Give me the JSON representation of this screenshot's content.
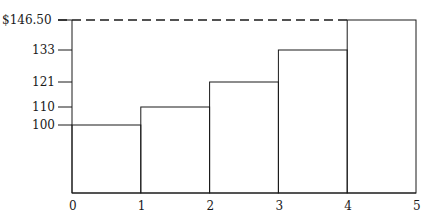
{
  "chart_data": {
    "type": "bar",
    "subtype": "step",
    "title": "",
    "xlabel": "",
    "ylabel": "",
    "categories": [
      "0-1",
      "1-2",
      "2-3",
      "3-4",
      "4-5"
    ],
    "x": [
      0,
      1,
      2,
      3,
      4,
      5
    ],
    "values": [
      100,
      110,
      121,
      133,
      146.5
    ],
    "xlim": [
      0,
      5
    ],
    "ylim_visible_ticks": [
      100,
      110,
      121,
      133,
      146.5
    ],
    "x_tick_labels": [
      "0",
      "1",
      "2",
      "3",
      "4",
      "5"
    ],
    "y_tick_labels": [
      "100",
      "110",
      "121",
      "133",
      "$146.50"
    ],
    "annotations": [
      {
        "type": "dashed-line",
        "y": 146.5,
        "from_x": 0,
        "to_x": 4
      }
    ],
    "grid": false,
    "legend": null
  },
  "colors": {
    "line": "#1a1a1a",
    "background": "#ffffff"
  }
}
